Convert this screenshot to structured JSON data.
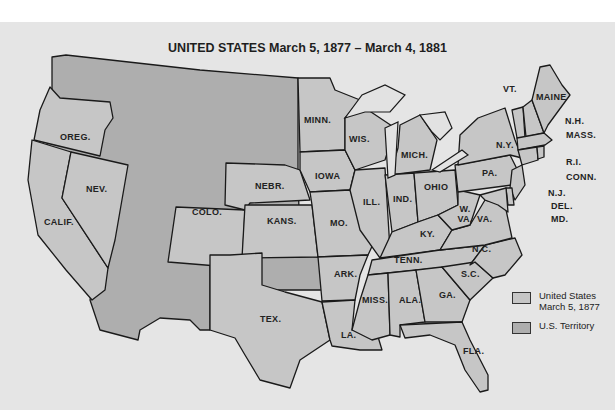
{
  "title": "UNITED STATES March 5, 1877 – March 4, 1881",
  "colors": {
    "background": "#e5e5e5",
    "state": "#c6c6c6",
    "territory": "#aeaeae",
    "border": "#1a1a1a"
  },
  "legend": [
    {
      "label_line1": "United States",
      "label_line2": "March 5, 1877",
      "color": "#c6c6c6"
    },
    {
      "label_line1": "U.S. Territory",
      "label_line2": "",
      "color": "#aeaeae"
    }
  ],
  "labels": {
    "oreg": "OREG.",
    "nev": "NEV.",
    "calif": "CALIF.",
    "colo": "COLO.",
    "nebr": "NEBR.",
    "kans": "KANS.",
    "minn": "MINN.",
    "iowa": "IOWA",
    "mo": "MO.",
    "ark": "ARK.",
    "tex": "TEX.",
    "la": "LA.",
    "wis": "WIS.",
    "ill": "ILL.",
    "mich": "MICH.",
    "ind": "IND.",
    "ohio": "OHIO",
    "ky": "KY.",
    "tenn": "TENN.",
    "miss": "MISS.",
    "ala": "ALA.",
    "ga": "GA.",
    "fla": "FLA.",
    "sc": "S.C.",
    "nc": "N.C.",
    "va": "VA.",
    "wva": "W. VA.",
    "pa": "PA.",
    "ny": "N.Y.",
    "vt": "VT.",
    "maine": "MAINE",
    "nh": "N.H.",
    "mass": "MASS.",
    "ri": "R.I.",
    "conn": "CONN.",
    "nj": "N.J.",
    "del": "DEL.",
    "md": "MD."
  }
}
